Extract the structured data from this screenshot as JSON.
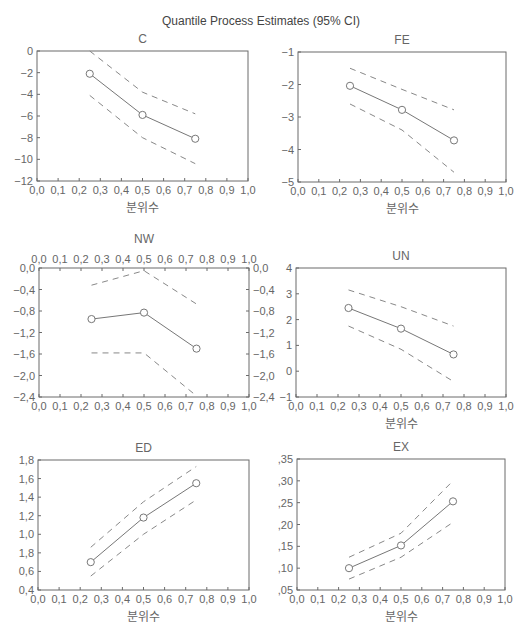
{
  "figure": {
    "title": "Quantile Process Estimates (95% CI)"
  },
  "chart_data": [
    {
      "type": "line",
      "title": "C",
      "xlabel": "분위수",
      "ylabel": "",
      "xlim": [
        0.0,
        1.0
      ],
      "ylim": [
        -12,
        0
      ],
      "xticks": [
        "0,0",
        "0,1",
        "0,2",
        "0,3",
        "0,4",
        "0,5",
        "0,6",
        "0,7",
        "0,8",
        "0,9",
        "1,0"
      ],
      "yticks": [
        0,
        -2,
        -4,
        -6,
        -8,
        -10,
        -12
      ],
      "ytick_labels": [
        "0",
        "−2",
        "−4",
        "−6",
        "−8",
        "−10",
        "−12"
      ],
      "x": [
        0.25,
        0.5,
        0.75
      ],
      "series": [
        {
          "name": "Estimate",
          "values": [
            -2.1,
            -5.9,
            -8.1
          ],
          "style": "solid-marker"
        },
        {
          "name": "Upper 95% CI",
          "values": [
            0.0,
            -3.8,
            -5.8
          ],
          "style": "dashed"
        },
        {
          "name": "Lower 95% CI",
          "values": [
            -4.1,
            -8.0,
            -10.4
          ],
          "style": "dashed"
        }
      ],
      "grid": false,
      "box": {
        "x": 37,
        "y": 51,
        "w": 211,
        "h": 130
      },
      "top_axis": false,
      "right_axis": false
    },
    {
      "type": "line",
      "title": "FE",
      "xlabel": "분위수",
      "ylabel": "",
      "xlim": [
        0.0,
        1.0
      ],
      "ylim": [
        -5,
        -1
      ],
      "xticks": [
        "0,0",
        "0,1",
        "0,2",
        "0,3",
        "0,4",
        "0,5",
        "0,6",
        "0,7",
        "0,8",
        "0,9",
        "1,0"
      ],
      "yticks": [
        -1,
        -2,
        -3,
        -4,
        -5
      ],
      "ytick_labels": [
        "−1",
        "−2",
        "−3",
        "−4",
        "−5"
      ],
      "x": [
        0.25,
        0.5,
        0.75
      ],
      "series": [
        {
          "name": "Estimate",
          "values": [
            -2.04,
            -2.78,
            -3.72
          ],
          "style": "solid-marker"
        },
        {
          "name": "Upper 95% CI",
          "values": [
            -1.5,
            -2.15,
            -2.78
          ],
          "style": "dashed"
        },
        {
          "name": "Lower 95% CI",
          "values": [
            -2.6,
            -3.4,
            -4.7
          ],
          "style": "dashed"
        }
      ],
      "grid": false,
      "box": {
        "x": 298,
        "y": 52,
        "w": 208,
        "h": 130
      },
      "top_axis": false,
      "right_axis": false
    },
    {
      "type": "line",
      "title": "NW",
      "xlabel": "",
      "ylabel": "",
      "xlim": [
        0.0,
        1.0
      ],
      "ylim": [
        -2.4,
        0.0
      ],
      "xticks": [
        "0,0",
        "0,1",
        "0,2",
        "0,3",
        "0,4",
        "0,5",
        "0,6",
        "0,7",
        "0,8",
        "0,9",
        "1,0"
      ],
      "yticks": [
        0.0,
        -0.4,
        -0.8,
        -1.2,
        -1.6,
        -2.0,
        -2.4
      ],
      "ytick_labels": [
        "0,0",
        "−0,4",
        "−0,8",
        "−1,2",
        "−1,6",
        "−2,0",
        "−2,4"
      ],
      "x": [
        0.25,
        0.5,
        0.75
      ],
      "series": [
        {
          "name": "Estimate",
          "values": [
            -0.95,
            -0.83,
            -1.5
          ],
          "style": "solid-marker"
        },
        {
          "name": "Upper 95% CI",
          "values": [
            -0.32,
            -0.05,
            -0.67
          ],
          "style": "dashed"
        },
        {
          "name": "Lower 95% CI",
          "values": [
            -1.58,
            -1.58,
            -2.38
          ],
          "style": "dashed"
        }
      ],
      "grid": false,
      "box": {
        "x": 39,
        "y": 268,
        "w": 210,
        "h": 129
      },
      "top_axis": true,
      "right_axis": true
    },
    {
      "type": "line",
      "title": "UN",
      "xlabel": "분위수",
      "ylabel": "",
      "xlim": [
        0.0,
        1.0
      ],
      "ylim": [
        -1,
        4
      ],
      "xticks": [
        "0,0",
        "0,1",
        "0,2",
        "0,3",
        "0,4",
        "0,5",
        "0,6",
        "0,7",
        "0,8",
        "0,9",
        "1,0"
      ],
      "yticks": [
        4,
        3,
        2,
        1,
        0,
        -1
      ],
      "ytick_labels": [
        "4",
        "3",
        "2",
        "1",
        "0",
        "−1"
      ],
      "x": [
        0.25,
        0.5,
        0.75
      ],
      "series": [
        {
          "name": "Estimate",
          "values": [
            2.45,
            1.65,
            0.65
          ],
          "style": "solid-marker"
        },
        {
          "name": "Upper 95% CI",
          "values": [
            3.15,
            2.5,
            1.75
          ],
          "style": "dashed"
        },
        {
          "name": "Lower 95% CI",
          "values": [
            1.75,
            0.85,
            -0.4
          ],
          "style": "dashed"
        }
      ],
      "grid": false,
      "box": {
        "x": 296,
        "y": 268,
        "w": 210,
        "h": 129
      },
      "top_axis": false,
      "right_axis": false
    },
    {
      "type": "line",
      "title": "ED",
      "xlabel": "분위수",
      "ylabel": "",
      "xlim": [
        0.0,
        1.0
      ],
      "ylim": [
        0.4,
        1.8
      ],
      "xticks": [
        "0,0",
        "0,1",
        "0,2",
        "0,3",
        "0,4",
        "0,5",
        "0,6",
        "0,7",
        "0,8",
        "0,9",
        "1,0"
      ],
      "yticks": [
        1.8,
        1.6,
        1.4,
        1.2,
        1.0,
        0.8,
        0.6,
        0.4
      ],
      "ytick_labels": [
        "1,8",
        "1,6",
        "1,4",
        "1,2",
        "1,0",
        "1,8",
        "0,6",
        "0,4"
      ],
      "x": [
        0.25,
        0.5,
        0.75
      ],
      "series": [
        {
          "name": "Estimate",
          "values": [
            0.7,
            1.18,
            1.55
          ],
          "style": "solid-marker"
        },
        {
          "name": "Upper 95% CI",
          "values": [
            0.86,
            1.35,
            1.73
          ],
          "style": "dashed"
        },
        {
          "name": "Lower 95% CI",
          "values": [
            0.55,
            1.0,
            1.37
          ],
          "style": "dashed"
        }
      ],
      "grid": false,
      "box": {
        "x": 38,
        "y": 460,
        "w": 211,
        "h": 130
      },
      "top_axis": false,
      "right_axis": false
    },
    {
      "type": "line",
      "title": "EX",
      "xlabel": "분위수",
      "ylabel": "",
      "xlim": [
        0.0,
        1.0
      ],
      "ylim": [
        0.05,
        0.35
      ],
      "xticks": [
        "0,0",
        "0,1",
        "0,2",
        "0,3",
        "0,4",
        "0,5",
        "0,6",
        "0,7",
        "0,8",
        "0,9",
        "1,0"
      ],
      "yticks": [
        0.35,
        0.3,
        0.25,
        0.2,
        0.15,
        0.1,
        0.05
      ],
      "ytick_labels": [
        ",35",
        ",30",
        ",25",
        ",20",
        ",15",
        ",10",
        ",05"
      ],
      "x": [
        0.25,
        0.5,
        0.75
      ],
      "series": [
        {
          "name": "Estimate",
          "values": [
            0.1,
            0.152,
            0.253
          ],
          "style": "solid-marker"
        },
        {
          "name": "Upper 95% CI",
          "values": [
            0.125,
            0.18,
            0.3
          ],
          "style": "dashed"
        },
        {
          "name": "Lower 95% CI",
          "values": [
            0.075,
            0.125,
            0.205
          ],
          "style": "dashed"
        }
      ],
      "grid": false,
      "box": {
        "x": 297,
        "y": 459,
        "w": 208,
        "h": 131
      },
      "top_axis": false,
      "right_axis": false
    }
  ]
}
